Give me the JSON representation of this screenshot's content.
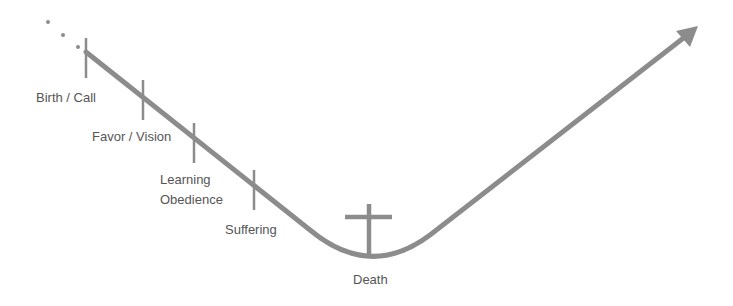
{
  "diagram": {
    "line_color": "#8c8c8c",
    "text_color": "#555555",
    "background": "#ffffff",
    "leading_dots": 3,
    "stages": [
      {
        "id": "birth-call",
        "label": "Birth / Call"
      },
      {
        "id": "favor-vision",
        "label": "Favor / Vision"
      },
      {
        "id": "learning-obedience",
        "label_line1": "Learning",
        "label_line2": "Obedience"
      },
      {
        "id": "suffering",
        "label": "Suffering"
      },
      {
        "id": "death",
        "label": "Death",
        "icon": "cross-icon"
      }
    ],
    "end_marker": "arrow-up-right"
  }
}
